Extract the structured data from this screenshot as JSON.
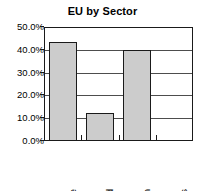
{
  "chart_data": {
    "type": "bar",
    "title": "EU by Sector",
    "xlabel": "",
    "ylabel": "",
    "categories": [
      "Textile",
      "Food",
      "Engin",
      "Stores"
    ],
    "values": [
      43.5,
      12.5,
      40.0,
      0.0
    ],
    "ylim": [
      0,
      50
    ],
    "ytick_values": [
      0,
      10,
      20,
      30,
      40,
      50
    ],
    "ytick_labels": [
      "0.0%",
      "10.0%",
      "20.0%",
      "30.0%",
      "40.0%",
      "50.0%"
    ],
    "grid": true,
    "legend": false,
    "legend_position": "none",
    "bar_fill_color": "#cccccc",
    "bar_border_color": "#1a1a1a",
    "axis_color": "#1a1a1a",
    "grid_color": "#4d4d4d",
    "background_color": "#ffffff",
    "text_color": "#000000"
  }
}
